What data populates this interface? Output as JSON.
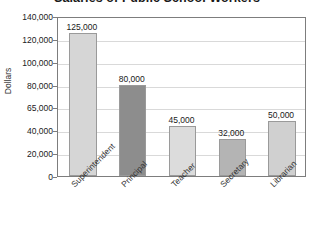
{
  "chart_data": {
    "type": "bar",
    "title": "Salaries of Public School Workers",
    "xlabel": "",
    "ylabel": "Dollars",
    "categories": [
      "Superintendent",
      "Principal",
      "Teacher",
      "Secretary",
      "Librarian"
    ],
    "values": [
      125000,
      80000,
      45000,
      32000,
      50000
    ],
    "value_labels": [
      "125,000",
      "80,000",
      "45,000",
      "32,000",
      "50,000"
    ],
    "ytick_labels": [
      "140,000",
      "120,000",
      "100,000",
      "80,000",
      "65,000",
      "40,000",
      "20,000",
      "0"
    ],
    "ytick_values": [
      140000,
      120000,
      100000,
      80000,
      65000,
      40000,
      20000,
      0
    ],
    "ylim": [
      0,
      140000
    ],
    "grid": true,
    "legend": "none",
    "bar_colors": [
      "#d6d6d6",
      "#8d8d8d",
      "#dcdcdc",
      "#b4b4b4",
      "#d0d0d0"
    ],
    "bar_edge_color": "#9a9a9a",
    "axis_color": "#7d7d7d",
    "gridline_color": "#d9d9d9",
    "text_color": "#222222",
    "background": "#ffffff"
  }
}
